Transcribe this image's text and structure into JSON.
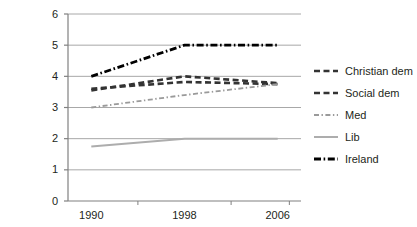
{
  "chart_data": {
    "type": "line",
    "title": "",
    "subtitle": "",
    "xlabel": "",
    "ylabel": "",
    "x": [
      1990,
      1998,
      2006
    ],
    "categories": [
      "1990",
      "1998",
      "2006"
    ],
    "xlim": [
      1988,
      2008
    ],
    "ylim": [
      0,
      6
    ],
    "ytick_labels": [
      "0",
      "1",
      "2",
      "3",
      "4",
      "5",
      "6"
    ],
    "ytick_values": [
      0,
      1,
      2,
      3,
      4,
      5,
      6
    ],
    "xtick_labels": [
      "1990",
      "1998",
      "2006"
    ],
    "grid": "horizontal",
    "legend_position": "right",
    "series": [
      {
        "name": "Christian dem",
        "values": [
          3.55,
          4.0,
          3.78
        ],
        "color": "#333333",
        "style": "dashed",
        "width": 2.6
      },
      {
        "name": "Social dem",
        "values": [
          3.6,
          3.82,
          3.75
        ],
        "color": "#333333",
        "style": "dashed",
        "width": 2.6
      },
      {
        "name": "Med",
        "values": [
          3.0,
          3.4,
          3.75
        ],
        "color": "#9a9a9a",
        "style": "dash-dot",
        "width": 1.8
      },
      {
        "name": "Lib",
        "values": [
          1.75,
          2.0,
          2.0
        ],
        "color": "#adadad",
        "style": "solid",
        "width": 2.0
      },
      {
        "name": "Ireland",
        "values": [
          4.0,
          5.0,
          5.0
        ],
        "color": "#000000",
        "style": "dash-dot",
        "width": 2.8
      }
    ]
  },
  "axes": {
    "y_labels": [
      {
        "text": "6",
        "value": 6
      },
      {
        "text": "5",
        "value": 5
      },
      {
        "text": "4",
        "value": 4
      },
      {
        "text": "3",
        "value": 3
      },
      {
        "text": "2",
        "value": 2
      },
      {
        "text": "1",
        "value": 1
      },
      {
        "text": "0",
        "value": 0
      }
    ],
    "x_labels": [
      {
        "text": "1990",
        "value": 1990
      },
      {
        "text": "1998",
        "value": 1998
      },
      {
        "text": "2006",
        "value": 2006
      }
    ]
  },
  "legend": {
    "items": [
      {
        "label": "Christian dem"
      },
      {
        "label": "Social dem"
      },
      {
        "label": "Med"
      },
      {
        "label": "Lib"
      },
      {
        "label": "Ireland"
      }
    ]
  },
  "colors": {
    "axis": "#808080",
    "grid": "#a8a8a8",
    "text": "#231f20",
    "background": "#ffffff"
  }
}
